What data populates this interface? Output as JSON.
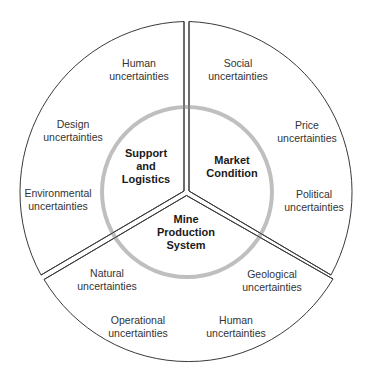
{
  "diagram": {
    "colors": {
      "outline": "#3a3a3a",
      "inner_ring": "#b8b8b8",
      "text": "#333333",
      "core_text": "#1a1a1a"
    },
    "cores": {
      "support": [
        "Support",
        "and",
        "Logistics"
      ],
      "market": [
        "Market",
        "Condition"
      ],
      "mine": [
        "Mine",
        "Production",
        "System"
      ]
    },
    "sectors": {
      "support_logistics": {
        "core": "Support and Logistics",
        "uncertainties": [
          [
            "Human",
            "uncertainties"
          ],
          [
            "Design",
            "uncertainties"
          ],
          [
            "Environmental",
            "uncertainties"
          ]
        ]
      },
      "market_condition": {
        "core": "Market Condition",
        "uncertainties": [
          [
            "Social",
            "uncertainties"
          ],
          [
            "Price",
            "uncertainties"
          ],
          [
            "Political",
            "uncertainties"
          ]
        ]
      },
      "mine_production": {
        "core": "Mine Production System",
        "uncertainties": [
          [
            "Natural",
            "uncertainties"
          ],
          [
            "Operational",
            "uncertainties"
          ],
          [
            "Human",
            "uncertainties"
          ],
          [
            "Geological",
            "uncertainties"
          ]
        ]
      }
    }
  }
}
